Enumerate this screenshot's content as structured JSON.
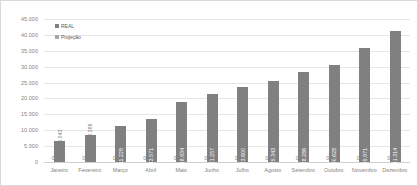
{
  "chart_data": {
    "type": "bar",
    "title": "",
    "xlabel": "",
    "ylabel": "",
    "ylim": [
      0,
      45000
    ],
    "grid": true,
    "legend_position": "top-left",
    "categories": [
      "Janeiro",
      "Fevereiro",
      "Março",
      "Abril",
      "Maio",
      "Junho",
      "Julho",
      "Agosto",
      "Setembro",
      "Outubro",
      "Novembro",
      "Dezembro"
    ],
    "y_ticks": [
      "0",
      "5.000",
      "10.000",
      "15.000",
      "20.000",
      "25.000",
      "30.000",
      "35.000",
      "40.000",
      "45.000"
    ],
    "y_tick_values": [
      0,
      5000,
      10000,
      15000,
      20000,
      25000,
      30000,
      35000,
      40000,
      45000
    ],
    "series": [
      {
        "name": "REAL",
        "color": "#808080",
        "values": [
          6543,
          8386,
          11229,
          13571,
          18934,
          21257,
          23600,
          25343,
          28286,
          30628,
          35971,
          41314
        ],
        "labels": [
          "6.543",
          "8.386",
          "11.229",
          "13.571",
          "18.934",
          "21.257",
          "23.600",
          "25.343",
          "28.286",
          "30.628",
          "35.971",
          "41.314"
        ]
      },
      {
        "name": "Projeção",
        "color": "#a6a6a6",
        "values": [
          0,
          0,
          0,
          0,
          0,
          0,
          0,
          0,
          0,
          0,
          0,
          0
        ],
        "labels": [
          "0",
          "0",
          "0",
          "0",
          "0",
          "0",
          "0",
          "0",
          "0",
          "0",
          "0",
          "0"
        ]
      }
    ]
  },
  "legend": {
    "items": [
      {
        "label": "REAL",
        "color": "#808080"
      },
      {
        "label": "Projeção",
        "color": "#a6a6a6"
      }
    ]
  },
  "colors": {
    "real": "#808080",
    "projecao": "#a6a6a6",
    "gridline": "#e6e6e6",
    "axis_text": "#7f7f7f",
    "plot_border": "#d9d9d9"
  }
}
